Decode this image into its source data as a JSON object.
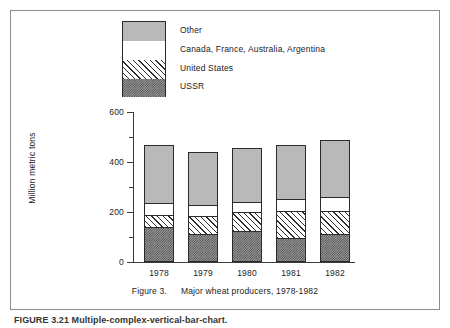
{
  "figure": {
    "caption_number": "Figure 3.",
    "caption_text": "Major wheat producers, 1978-1982",
    "undertext": "FIGURE 3.21  Multiple-complex-vertical-bar-chart.",
    "frame_color": "#8c8c8c"
  },
  "legend": {
    "items": [
      {
        "label": "Other",
        "swatch": "solid-gray",
        "color": "#b9b9b9"
      },
      {
        "label": "Canada, France, Australia, Argentina",
        "swatch": "white",
        "color": "#ffffff"
      },
      {
        "label": "United States",
        "swatch": "diagonal-hatch",
        "color": "#2e2e2e"
      },
      {
        "label": "USSR",
        "swatch": "checker-dither",
        "color": "#4a4a4a"
      }
    ]
  },
  "chart_data": {
    "type": "bar",
    "subtype": "stacked",
    "title": "Major wheat producers, 1978-1982",
    "xlabel": "",
    "ylabel": "Million metric tons",
    "categories": [
      "1978",
      "1979",
      "1980",
      "1981",
      "1982"
    ],
    "ylim": [
      0,
      600
    ],
    "yticks": [
      0,
      200,
      400,
      600
    ],
    "yticks_minor": [
      100,
      300,
      500
    ],
    "ytick_labels": [
      "0",
      "200",
      "400",
      "600"
    ],
    "grid": false,
    "legend_position": "top-center",
    "stack_order_bottom_to_top": [
      "USSR",
      "United States",
      "Canada, France, Australia, Argentina",
      "Other"
    ],
    "series": [
      {
        "name": "USSR",
        "values": [
          137,
          109,
          121,
          93,
          109
        ]
      },
      {
        "name": "United States",
        "values": [
          52,
          76,
          80,
          109,
          93
        ]
      },
      {
        "name": "Canada, France, Australia, Argentina",
        "values": [
          48,
          44,
          40,
          52,
          60
        ]
      },
      {
        "name": "Other",
        "values": [
          233,
          211,
          214,
          213,
          228
        ]
      }
    ],
    "totals": [
      470,
      440,
      455,
      467,
      490
    ],
    "units": "million metric tons"
  }
}
